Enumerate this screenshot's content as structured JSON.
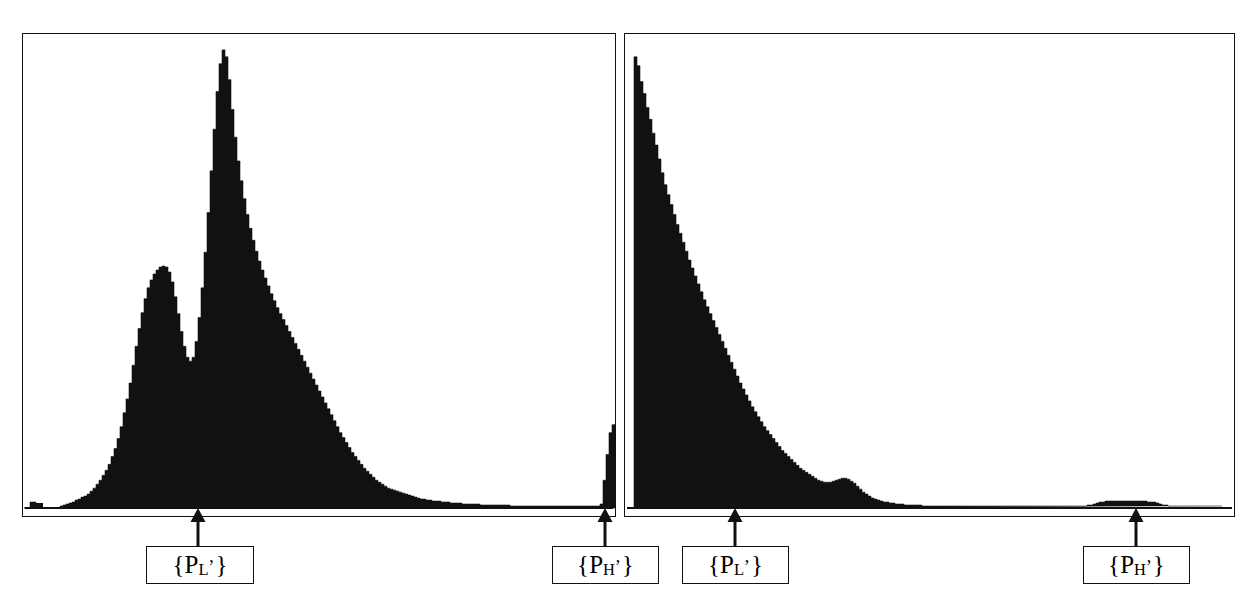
{
  "figure": {
    "type": "two-panel-histogram-figure",
    "background": "#ffffff",
    "ink_color": "#111111",
    "width": 1257,
    "height": 613
  },
  "panels": [
    {
      "id": "left-panel",
      "name": "left-histogram-panel",
      "x": 22,
      "y": 33,
      "width": 594,
      "height": 484,
      "baseline_y": 508
    },
    {
      "id": "right-panel",
      "name": "right-histogram-panel",
      "x": 624,
      "y": 33,
      "width": 611,
      "height": 484,
      "baseline_y": 508
    }
  ],
  "annotations": [
    {
      "id": "left-PL",
      "label_prefix": "{P",
      "label_sub": "L",
      "label_prime": "’",
      "label_suffix": "}",
      "label_plain": "{P_L'}",
      "arrow_x": 198,
      "arrow_top_y": 509,
      "arrow_bottom_y": 546,
      "box": {
        "x": 146,
        "y": 546,
        "width": 108,
        "height": 38
      }
    },
    {
      "id": "left-PH",
      "label_prefix": "{P",
      "label_sub": "H",
      "label_prime": "’",
      "label_suffix": "}",
      "label_plain": "{P_H'}",
      "arrow_x": 605,
      "arrow_top_y": 509,
      "arrow_bottom_y": 546,
      "box": {
        "x": 552,
        "y": 546,
        "width": 107,
        "height": 38
      }
    },
    {
      "id": "right-PL",
      "label_prefix": "{P",
      "label_sub": "L",
      "label_prime": "’",
      "label_suffix": "}",
      "label_plain": "{P_L'}",
      "arrow_x": 735,
      "arrow_top_y": 509,
      "arrow_bottom_y": 546,
      "box": {
        "x": 682,
        "y": 546,
        "width": 107,
        "height": 38
      }
    },
    {
      "id": "right-PH",
      "label_prefix": "{P",
      "label_sub": "H",
      "label_prime": "’",
      "label_suffix": "}",
      "label_plain": "{P_H'}",
      "arrow_x": 1136,
      "arrow_top_y": 509,
      "arrow_bottom_y": 546,
      "box": {
        "x": 1083,
        "y": 546,
        "width": 107,
        "height": 38
      }
    }
  ],
  "chart_data": [
    {
      "type": "bar",
      "id": "left-histogram",
      "title": "",
      "xlabel": "",
      "ylabel": "",
      "grid": false,
      "legend": "none",
      "annotations": [
        "{P_L'}",
        "{P_H'}"
      ],
      "xlim": [
        0,
        594
      ],
      "ylim": [
        0,
        475
      ],
      "note": "Bimodal main distribution with a small secondary mode near x=133, a dominant tall mode near x=196, a long low right tail, an isolated low mark at the far left, and a narrow isolated spike near the right edge marked {P_H'}.",
      "bin_width_px": 3,
      "bins_x": [
        24,
        27,
        30,
        33,
        36,
        39,
        42,
        45,
        48,
        51,
        54,
        57,
        60,
        63,
        66,
        69,
        72,
        75,
        78,
        81,
        84,
        87,
        90,
        93,
        96,
        99,
        102,
        105,
        108,
        111,
        114,
        117,
        120,
        123,
        126,
        129,
        132,
        135,
        138,
        141,
        144,
        147,
        150,
        153,
        156,
        159,
        162,
        165,
        168,
        171,
        174,
        177,
        180,
        183,
        186,
        189,
        192,
        195,
        198,
        201,
        204,
        207,
        210,
        213,
        216,
        219,
        222,
        225,
        228,
        231,
        234,
        237,
        240,
        243,
        246,
        249,
        252,
        255,
        258,
        261,
        264,
        267,
        270,
        273,
        276,
        279,
        282,
        285,
        288,
        291,
        294,
        297,
        300,
        303,
        306,
        309,
        312,
        315,
        318,
        321,
        324,
        327,
        330,
        333,
        336,
        339,
        342,
        345,
        348,
        351,
        354,
        357,
        360,
        363,
        366,
        369,
        372,
        375,
        378,
        381,
        384,
        387,
        390,
        393,
        396,
        399,
        402,
        405,
        408,
        411,
        414,
        417,
        420,
        423,
        426,
        429,
        432,
        435,
        438,
        441,
        444,
        447,
        450,
        453,
        456,
        459,
        462,
        465,
        468,
        471,
        474,
        477,
        480,
        483,
        486,
        489,
        492,
        495,
        498,
        501,
        504,
        507,
        510,
        513,
        516,
        519,
        522,
        525,
        528,
        531,
        534,
        537,
        540,
        543,
        546,
        549,
        552,
        555,
        558,
        561,
        564,
        567,
        570,
        573,
        576,
        579,
        582,
        585,
        588,
        591,
        594,
        597,
        600,
        603,
        606,
        609,
        612
      ],
      "values": [
        0,
        0,
        6,
        6,
        0,
        0,
        0,
        0,
        0,
        0,
        0,
        0,
        2,
        3,
        4,
        5,
        6,
        8,
        9,
        11,
        12,
        14,
        17,
        20,
        24,
        28,
        33,
        38,
        44,
        52,
        60,
        70,
        82,
        96,
        110,
        126,
        144,
        163,
        181,
        197,
        211,
        222,
        230,
        236,
        240,
        243,
        244,
        243,
        238,
        228,
        213,
        196,
        178,
        163,
        152,
        148,
        152,
        168,
        192,
        222,
        258,
        298,
        340,
        382,
        420,
        448,
        462,
        455,
        432,
        402,
        374,
        350,
        330,
        312,
        296,
        282,
        270,
        259,
        249,
        240,
        232,
        224,
        216,
        209,
        202,
        196,
        190,
        184,
        178,
        172,
        166,
        160,
        154,
        148,
        142,
        136,
        130,
        124,
        118,
        112,
        106,
        100,
        94,
        88,
        82,
        76,
        71,
        66,
        61,
        56,
        52,
        48,
        44,
        40,
        37,
        34,
        31,
        28,
        26,
        24,
        22,
        20,
        19,
        18,
        17,
        16,
        15,
        14,
        13,
        12,
        11,
        10,
        9,
        9,
        8,
        8,
        7,
        7,
        7,
        6,
        6,
        6,
        5,
        5,
        5,
        5,
        4,
        4,
        4,
        4,
        4,
        4,
        3,
        3,
        3,
        3,
        3,
        3,
        3,
        3,
        3,
        3,
        2,
        2,
        2,
        2,
        2,
        2,
        2,
        2,
        2,
        2,
        2,
        2,
        2,
        2,
        2,
        2,
        2,
        2,
        2,
        2,
        2,
        2,
        2,
        2,
        2,
        2,
        2,
        2,
        2,
        2,
        4,
        28,
        54,
        76,
        84,
        88,
        0
      ]
    },
    {
      "type": "bar",
      "id": "right-histogram",
      "title": "",
      "xlabel": "",
      "ylabel": "",
      "grid": false,
      "legend": "none",
      "annotations": [
        "{P_L'}",
        "{P_H'}"
      ],
      "xlim": [
        0,
        611
      ],
      "ylim": [
        0,
        475
      ],
      "note": "Sharply peaked exponential-decay distribution rising immediately at the left edge, decaying to a small secondary bump near x=735, then a flat near-zero tail with a low broad mound near x=1100-1175 marked {P_H'}.",
      "bin_width_px": 3,
      "bins_x": [
        628,
        631,
        634,
        637,
        640,
        643,
        646,
        649,
        652,
        655,
        658,
        661,
        664,
        667,
        670,
        673,
        676,
        679,
        682,
        685,
        688,
        691,
        694,
        697,
        700,
        703,
        706,
        709,
        712,
        715,
        718,
        721,
        724,
        727,
        730,
        733,
        736,
        739,
        742,
        745,
        748,
        751,
        754,
        757,
        760,
        763,
        766,
        769,
        772,
        775,
        778,
        781,
        784,
        787,
        790,
        793,
        796,
        799,
        802,
        805,
        808,
        811,
        814,
        817,
        820,
        823,
        826,
        829,
        832,
        835,
        838,
        841,
        844,
        847,
        850,
        853,
        856,
        859,
        862,
        865,
        868,
        871,
        874,
        877,
        880,
        883,
        886,
        889,
        892,
        895,
        898,
        901,
        904,
        907,
        910,
        913,
        916,
        919,
        922,
        925,
        928,
        931,
        934,
        937,
        940,
        943,
        946,
        949,
        952,
        955,
        958,
        961,
        964,
        967,
        970,
        973,
        976,
        979,
        982,
        985,
        988,
        991,
        994,
        997,
        1000,
        1003,
        1006,
        1009,
        1012,
        1015,
        1018,
        1021,
        1024,
        1027,
        1030,
        1033,
        1036,
        1039,
        1042,
        1045,
        1048,
        1051,
        1054,
        1057,
        1060,
        1063,
        1066,
        1069,
        1072,
        1075,
        1078,
        1081,
        1084,
        1087,
        1090,
        1093,
        1096,
        1099,
        1102,
        1105,
        1108,
        1111,
        1114,
        1117,
        1120,
        1123,
        1126,
        1129,
        1132,
        1135,
        1138,
        1141,
        1144,
        1147,
        1150,
        1153,
        1156,
        1159,
        1162,
        1165,
        1168,
        1171,
        1174,
        1177,
        1180,
        1183,
        1186,
        1189,
        1192,
        1195,
        1198,
        1201,
        1204,
        1207,
        1210,
        1213,
        1216,
        1219,
        1222,
        1225,
        1228,
        1231
      ],
      "values": [
        0,
        0,
        455,
        446,
        430,
        418,
        404,
        392,
        378,
        366,
        352,
        338,
        326,
        316,
        306,
        296,
        286,
        277,
        268,
        259,
        250,
        242,
        234,
        226,
        218,
        210,
        203,
        196,
        189,
        182,
        175,
        168,
        161,
        154,
        147,
        140,
        133,
        126,
        120,
        114,
        108,
        102,
        97,
        92,
        87,
        82,
        78,
        74,
        70,
        66,
        62,
        58,
        55,
        52,
        49,
        46,
        43,
        40,
        38,
        36,
        34,
        32,
        30,
        28,
        27,
        26,
        26,
        26,
        27,
        28,
        29,
        30,
        30,
        29,
        27,
        25,
        22,
        19,
        16,
        14,
        12,
        10,
        9,
        8,
        7,
        6,
        6,
        5,
        5,
        4,
        4,
        4,
        3,
        3,
        3,
        3,
        3,
        3,
        2,
        2,
        2,
        2,
        2,
        2,
        2,
        2,
        2,
        2,
        2,
        2,
        2,
        2,
        2,
        2,
        2,
        2,
        2,
        2,
        2,
        2,
        2,
        2,
        2,
        2,
        2,
        2,
        2,
        2,
        2,
        2,
        2,
        2,
        2,
        2,
        2,
        2,
        2,
        2,
        2,
        2,
        2,
        2,
        2,
        2,
        2,
        2,
        2,
        2,
        2,
        2,
        2,
        2,
        2,
        3,
        3,
        4,
        5,
        6,
        6,
        7,
        7,
        7,
        7,
        7,
        7,
        7,
        7,
        7,
        7,
        7,
        7,
        7,
        7,
        6,
        6,
        6,
        5,
        4,
        3,
        3,
        2,
        2,
        2,
        2,
        2,
        2,
        2,
        2,
        2,
        2,
        2,
        2,
        2,
        2,
        2,
        2,
        2,
        2
      ]
    }
  ]
}
